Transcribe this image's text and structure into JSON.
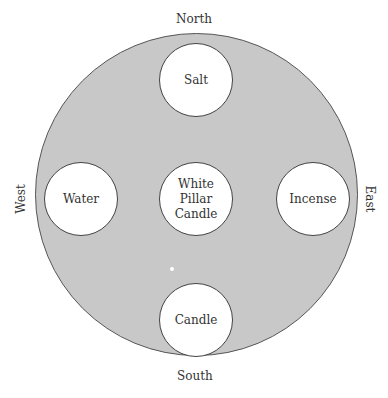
{
  "directions": {
    "north": "North",
    "south": "South",
    "west": "West",
    "east": "East"
  },
  "altar": {
    "fill_color": "#c8c8c8",
    "items": [
      {
        "id": "salt",
        "label": "Salt",
        "position": "north"
      },
      {
        "id": "water",
        "label": "Water",
        "position": "west"
      },
      {
        "id": "center",
        "label": "White Pillar Candle",
        "position": "center"
      },
      {
        "id": "incense",
        "label": "Incense",
        "position": "east"
      },
      {
        "id": "candle",
        "label": "Candle",
        "position": "south"
      }
    ]
  }
}
